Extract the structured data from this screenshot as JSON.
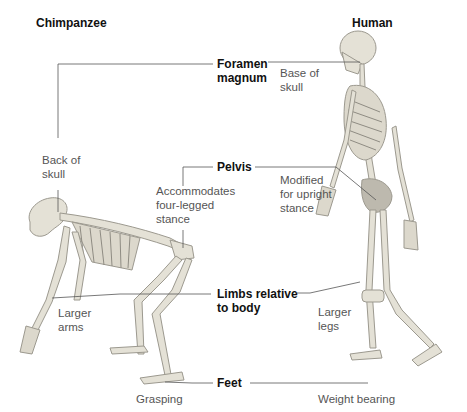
{
  "species": {
    "left": {
      "title": "Chimpanzee"
    },
    "right": {
      "title": "Human"
    }
  },
  "features": [
    {
      "name": "Foramen\nmagnum",
      "chimpanzee": "Back of\nskull",
      "human": "Base of\nskull"
    },
    {
      "name": "Pelvis",
      "chimpanzee": "Accommodates\nfour-legged\nstance",
      "human": "Modified\nfor upright\nstance"
    },
    {
      "name": "Limbs relative\nto body",
      "chimpanzee": "Larger\narms",
      "human": "Larger\nlegs"
    },
    {
      "name": "Feet",
      "chimpanzee": "Grasping",
      "human": "Weight bearing"
    }
  ],
  "colors": {
    "background": "#ffffff",
    "leader_line": "#555555",
    "bone": "#e4e1d6",
    "bone_shadow": "#9c998f"
  }
}
